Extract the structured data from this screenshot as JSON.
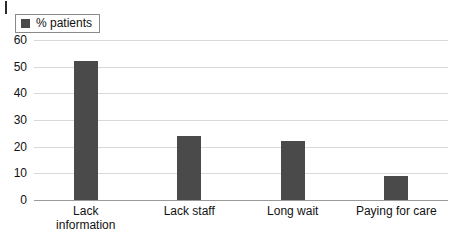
{
  "legend": {
    "label": "% patients",
    "swatch_color": "#4a4a4a",
    "position": "top-left"
  },
  "style": {
    "bar_color": "#4a4a4a",
    "gridline_color": "#d9d9d9",
    "axis_color": "#9a9a9a",
    "background": "#ffffff",
    "text_color": "#111111"
  },
  "chart_data": {
    "type": "bar",
    "title": "",
    "subtitle": "",
    "xlabel": "",
    "ylabel": "",
    "categories": [
      "Lack information",
      "Lack staff",
      "Long wait",
      "Paying for care"
    ],
    "category_lines": [
      [
        "Lack",
        "information"
      ],
      [
        "Lack staff"
      ],
      [
        "Long wait"
      ],
      [
        "Paying for care"
      ]
    ],
    "series": [
      {
        "name": "% patients",
        "values": [
          52,
          24,
          22,
          9
        ],
        "color": "#4a4a4a"
      }
    ],
    "values": [
      52,
      24,
      22,
      9
    ],
    "ylim": [
      0,
      60
    ],
    "ytick_step": 10,
    "yticks": [
      0,
      10,
      20,
      30,
      40,
      50,
      60
    ],
    "ytick_labels": [
      "0",
      "10",
      "20",
      "30",
      "40",
      "50",
      "60"
    ],
    "grid": "horizontal",
    "legend_position": "top-left"
  }
}
